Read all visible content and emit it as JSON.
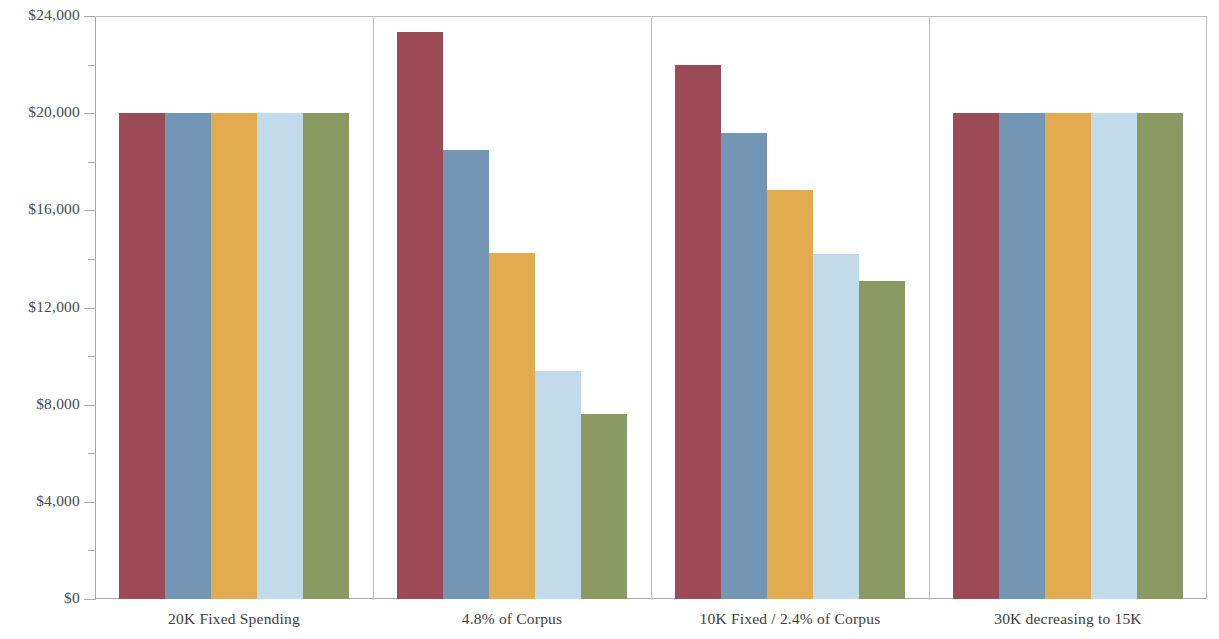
{
  "chart_data": {
    "type": "bar",
    "title": "",
    "subtitle": "",
    "xlabel": "",
    "ylabel": "",
    "ylim": [
      0,
      24000
    ],
    "grid": false,
    "legend": "none",
    "y_ticks_major": [
      0,
      4000,
      8000,
      12000,
      16000,
      20000,
      24000
    ],
    "y_tick_labels": [
      "$0",
      "$4,000",
      "$8,000",
      "$12,000",
      "$16,000",
      "$20,000",
      "$24,000"
    ],
    "y_ticks_minor": [
      2000,
      6000,
      10000,
      14000,
      18000,
      22000
    ],
    "categories": [
      "20K Fixed Spending",
      "4.8% of Corpus",
      "10K Fixed / 2.4% of Corpus",
      "30K decreasing to 15K"
    ],
    "series": [
      {
        "name": "series-1",
        "color": "#9c4a55",
        "values": [
          20000,
          23350,
          22000,
          20000
        ]
      },
      {
        "name": "series-2",
        "color": "#7296b4",
        "values": [
          20000,
          18500,
          19200,
          20000
        ]
      },
      {
        "name": "series-3",
        "color": "#e2ab4f",
        "values": [
          20000,
          14250,
          16850,
          20000
        ]
      },
      {
        "name": "series-4",
        "color": "#c2dbea",
        "values": [
          20000,
          9400,
          14200,
          20000
        ]
      },
      {
        "name": "series-5",
        "color": "#8b9a62",
        "values": [
          20000,
          7600,
          13100,
          20000
        ]
      }
    ],
    "colors": {
      "series_1_maroon": "#9c4a55",
      "series_2_steel_blue": "#7296b4",
      "series_3_goldenrod": "#e2ab4f",
      "series_4_light_blue": "#c2dbea",
      "series_5_olive": "#8b9a62",
      "axis": "#a9a9a9",
      "divider": "#bdbdbd",
      "text": "#4a4a4a",
      "background": "#ffffff"
    }
  }
}
